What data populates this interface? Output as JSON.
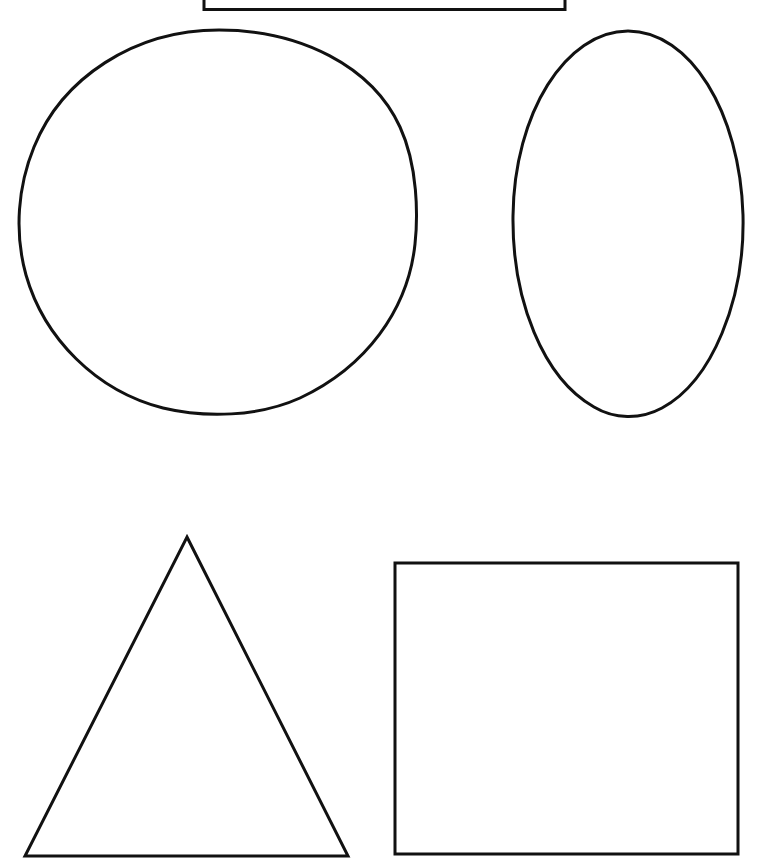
{
  "page": {
    "title": "Basic Shapes Outline Sheet",
    "width": 760,
    "height": 861,
    "background_color": "#ffffff",
    "stroke_color": "#111111"
  },
  "shapes": [
    {
      "id": "rectangle-top",
      "name": "rectangle",
      "label": "Rectangle",
      "stroke_color": "#111111",
      "stroke_width": 3,
      "fill": "none",
      "clipped_by_image_edge": true,
      "geometry": {
        "type": "rect",
        "x": 204,
        "y": -18,
        "width": 361,
        "height": 28
      }
    },
    {
      "id": "circle-large",
      "name": "circle",
      "label": "Circle",
      "stroke_color": "#111111",
      "stroke_width": 3,
      "fill": "none",
      "clipped_by_image_edge": false,
      "geometry": {
        "type": "ellipse",
        "cx": 219,
        "cy": 222,
        "rx": 198,
        "ry": 192
      }
    },
    {
      "id": "ellipse-oval",
      "name": "oval",
      "label": "Oval",
      "stroke_color": "#111111",
      "stroke_width": 3,
      "fill": "none",
      "clipped_by_image_edge": false,
      "geometry": {
        "type": "ellipse",
        "cx": 628,
        "cy": 223,
        "rx": 115,
        "ry": 192
      }
    },
    {
      "id": "triangle-equilateral",
      "name": "triangle",
      "label": "Triangle",
      "stroke_color": "#111111",
      "stroke_width": 3,
      "fill": "none",
      "clipped_by_image_edge": false,
      "geometry": {
        "type": "polygon",
        "points": "187,537 348,856 25,856"
      }
    },
    {
      "id": "square-large",
      "name": "square",
      "label": "Square",
      "stroke_color": "#111111",
      "stroke_width": 3,
      "fill": "none",
      "clipped_by_image_edge": false,
      "geometry": {
        "type": "rect",
        "x": 395,
        "y": 563,
        "width": 343,
        "height": 291
      }
    }
  ],
  "chart_data": {
    "type": "diagram",
    "title": "Basic Shapes Outline Sheet",
    "items": [
      {
        "shape": "rectangle",
        "position": "top-center",
        "filled": false,
        "outline": "black"
      },
      {
        "shape": "circle",
        "position": "upper-left",
        "filled": false,
        "outline": "black"
      },
      {
        "shape": "oval",
        "position": "upper-right",
        "filled": false,
        "outline": "black"
      },
      {
        "shape": "triangle",
        "position": "lower-left",
        "filled": false,
        "outline": "black"
      },
      {
        "shape": "square",
        "position": "lower-right",
        "filled": false,
        "outline": "black"
      }
    ],
    "count": 5
  }
}
